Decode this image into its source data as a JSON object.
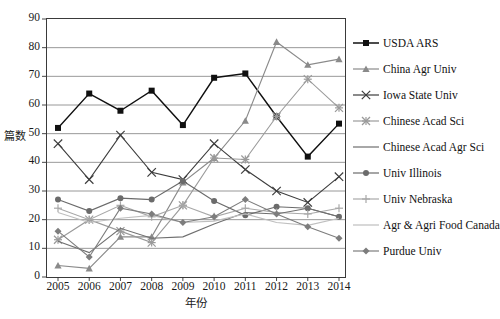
{
  "chart_data": {
    "type": "line",
    "title": "",
    "xlabel": "年份",
    "ylabel": "篇数",
    "grid": true,
    "legend_position": "right",
    "xlim": [
      2005,
      2014
    ],
    "ylim": [
      0,
      90
    ],
    "ytick_step": 10,
    "categories": [
      "2005",
      "2006",
      "2007",
      "2008",
      "2009",
      "2010",
      "2011",
      "2012",
      "2013",
      "2014"
    ],
    "yticks": [
      "0",
      "10",
      "20",
      "30",
      "40",
      "50",
      "60",
      "70",
      "80",
      "90"
    ],
    "series": [
      {
        "name": "USDA ARS",
        "marker": "square",
        "color": "#101010",
        "values": [
          52,
          64,
          58,
          65,
          53,
          69.5,
          71,
          56,
          42,
          53.5
        ]
      },
      {
        "name": "China Agr Univ",
        "marker": "triangle",
        "color": "#8a8a8a",
        "values": [
          4,
          3,
          14,
          14,
          33,
          41.5,
          54.5,
          82,
          74,
          76
        ]
      },
      {
        "name": "Iowa State Univ",
        "marker": "x",
        "color": "#3c3c3c",
        "values": [
          46.5,
          34,
          49.5,
          36.5,
          34,
          46.5,
          37.5,
          30,
          26,
          35
        ]
      },
      {
        "name": "Chinese Acad Sci",
        "marker": "asterisk",
        "color": "#9a9a9a",
        "values": [
          13,
          20,
          16,
          12,
          25,
          41.5,
          41,
          56,
          69,
          59
        ]
      },
      {
        "name": "Univ Illinois",
        "marker": "circle",
        "color": "#6b6b6b",
        "values": [
          27,
          23,
          27.5,
          27,
          33.5,
          26.5,
          21.5,
          24.5,
          24,
          21
        ]
      },
      {
        "name": "Univ Nebraska",
        "marker": "plus",
        "color": "#a8a8a8",
        "values": [
          24,
          20,
          25,
          21,
          25,
          21,
          24,
          22.5,
          22,
          24
        ]
      },
      {
        "name": "Chinese Acad Agr Sci",
        "marker": "line",
        "color": "#6f6f6f",
        "values": [
          12.5,
          8.5,
          17,
          13.5,
          14,
          18.5,
          22.5,
          22,
          24,
          21
        ]
      },
      {
        "name": "Agr & Agri Food Canada",
        "marker": "line",
        "color": "#bfbfbf",
        "values": [
          22.5,
          19,
          20.5,
          21.5,
          19,
          19.5,
          22,
          19,
          18,
          20.5
        ]
      },
      {
        "name": "Purdue Univ",
        "marker": "diamond",
        "color": "#7d7d7d",
        "values": [
          16,
          7,
          24,
          22,
          19,
          21,
          27,
          22,
          17.5,
          13.5
        ]
      }
    ]
  },
  "legend": {
    "entries": [
      "USDA ARS",
      "China Agr Univ",
      "Iowa State Univ",
      "Chinese Acad Sci",
      "Chinese Acad Agr Sci",
      "Univ Illinois",
      "Univ Nebraska",
      "Agr & Agri Food Canada",
      "Purdue Univ"
    ]
  }
}
